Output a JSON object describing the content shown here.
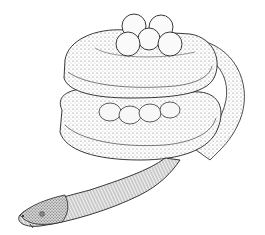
{
  "image": {
    "subject": "caecilian coiled around egg clutch",
    "style": "pen-and-ink stipple illustration",
    "colors": {
      "background": "#ffffff",
      "ink": "#1a1a1a",
      "shade": "#8a8a8a",
      "light": "#e6e6e6"
    },
    "egg_count_visible": 9
  }
}
